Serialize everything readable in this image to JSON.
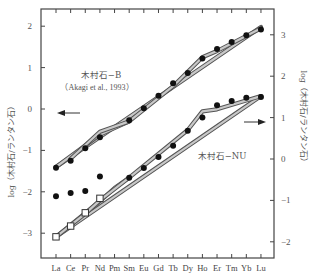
{
  "chart_data": {
    "type": "line",
    "title": "",
    "xlabel": "",
    "categories": [
      "La",
      "Ce",
      "Pr",
      "Nd",
      "Pm",
      "Sm",
      "Eu",
      "Gd",
      "Tb",
      "Dy",
      "Ho",
      "Er",
      "Tm",
      "Yb",
      "Lu"
    ],
    "left_axis": {
      "label": "log（木村石/ランタン石）",
      "ticks": [
        2,
        1,
        0,
        -1,
        -2,
        -3
      ],
      "ylim": [
        -3.6,
        2.4
      ]
    },
    "right_axis": {
      "label": "log（木村石/ランタン石）",
      "ticks": [
        3,
        2,
        1,
        0,
        -1,
        -2
      ],
      "ylim": [
        -2.4,
        3.6
      ]
    },
    "series": [
      {
        "name": "木村石-B (Akagi et al., 1993)",
        "axis": "left",
        "marker": "filled-circle",
        "values": [
          -1.42,
          -1.25,
          -0.95,
          -0.68,
          null,
          -0.27,
          0.02,
          0.32,
          0.62,
          0.87,
          1.22,
          1.45,
          1.62,
          1.78,
          1.92
        ]
      },
      {
        "name": "木村石-NU",
        "axis": "right",
        "marker": "filled-circle",
        "values": [
          -0.9,
          -0.82,
          -0.77,
          -0.42,
          null,
          -0.45,
          -0.22,
          0.05,
          0.32,
          0.68,
          1.0,
          1.3,
          1.4,
          1.48,
          1.5
        ]
      },
      {
        "name": "木村石-NU (open squares)",
        "axis": "right",
        "marker": "open-square",
        "values": [
          -1.88,
          -1.62,
          -1.3,
          -0.95,
          null,
          null,
          null,
          null,
          null,
          null,
          null,
          null,
          null,
          null,
          null
        ]
      }
    ],
    "annotations": [
      {
        "text": "木村石−B",
        "sub": "(Akagi et al., 1993)"
      },
      {
        "text": "木村石−NU"
      },
      {
        "text": "← arrow pointing to left axis (upper series)"
      },
      {
        "text": "→ arrow pointing to right axis (lower series)"
      }
    ],
    "grid": false,
    "legend": "none"
  },
  "labels": {
    "upper_name": "木村石−B",
    "upper_ref": "（Akagi et al., 1993）",
    "lower_name": "木村石−NU",
    "left_axis_title": "log（木村石/ランタン石）",
    "right_axis_title": "log（木村石/ランタン石）"
  }
}
